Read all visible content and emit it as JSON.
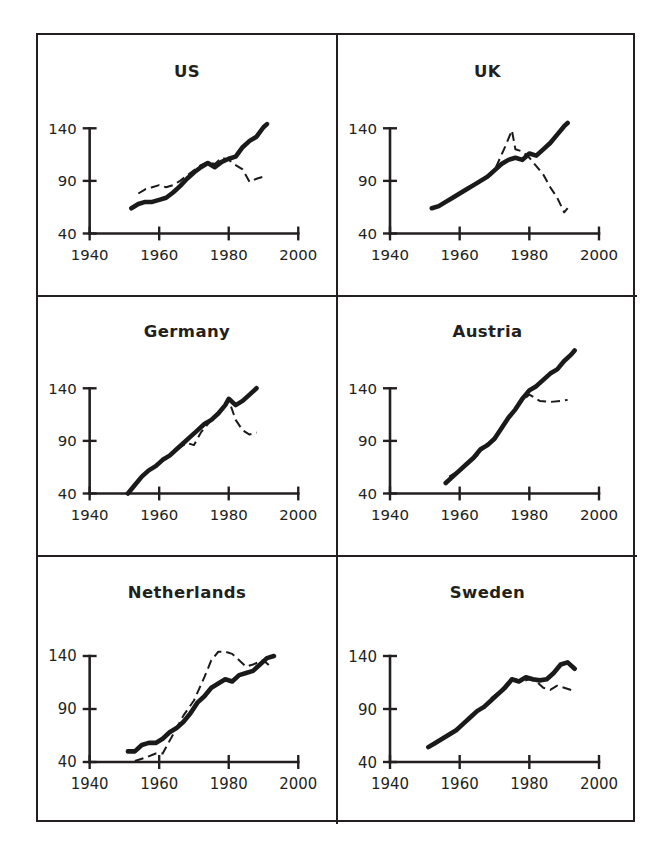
{
  "figure": {
    "layout": "2x3 grid of small-multiple line charts",
    "panel_order": [
      "US",
      "UK",
      "Germany",
      "Austria",
      "Netherlands",
      "Sweden"
    ]
  },
  "axes": {
    "x_ticks": [
      1940,
      1960,
      1980,
      2000
    ],
    "x_tick_labels": [
      "1940",
      "1960",
      "1980",
      "2000"
    ],
    "y_ticks": [
      40,
      90,
      140
    ],
    "y_tick_labels": [
      "140",
      "90",
      "40"
    ],
    "xlim": [
      1940,
      2000
    ],
    "ylim": [
      40,
      190
    ]
  },
  "titles": {
    "us": "US",
    "uk": "UK",
    "germany": "Germany",
    "austria": "Austria",
    "netherlands": "Netherlands",
    "sweden": "Sweden"
  },
  "colors": {
    "ink": "#231f20",
    "background": "#ffffff",
    "series_solid": "#1a1a1a",
    "series_dashed": "#1a1a1a"
  },
  "chart_data": [
    {
      "type": "line",
      "title": "US",
      "xlabel": "",
      "ylabel": "",
      "xlim": [
        1940,
        2000
      ],
      "ylim": [
        40,
        190
      ],
      "xticks": [
        1940,
        1960,
        1980,
        2000
      ],
      "yticks": [
        40,
        90,
        140
      ],
      "grid": false,
      "legend": "none",
      "series": [
        {
          "name": "solid",
          "style": "solid-thick",
          "x": [
            1952,
            1954,
            1956,
            1958,
            1960,
            1962,
            1964,
            1966,
            1968,
            1970,
            1972,
            1974,
            1976,
            1978,
            1980,
            1982,
            1984,
            1986,
            1988,
            1990,
            1991
          ],
          "y": [
            64,
            68,
            70,
            70,
            72,
            74,
            79,
            85,
            92,
            98,
            103,
            107,
            103,
            108,
            111,
            113,
            122,
            128,
            132,
            141,
            144
          ]
        },
        {
          "name": "dashed",
          "style": "dashed-thin",
          "x": [
            1954,
            1956,
            1958,
            1960,
            1962,
            1964,
            1966,
            1968,
            1970,
            1972,
            1974,
            1976,
            1978,
            1980,
            1982,
            1984,
            1986,
            1988,
            1990
          ],
          "y": [
            78,
            82,
            84,
            86,
            84,
            86,
            90,
            95,
            100,
            105,
            108,
            106,
            112,
            110,
            105,
            101,
            89,
            92,
            94
          ]
        }
      ]
    },
    {
      "type": "line",
      "title": "UK",
      "xlabel": "",
      "ylabel": "",
      "xlim": [
        1940,
        2000
      ],
      "ylim": [
        40,
        190
      ],
      "xticks": [
        1940,
        1960,
        1980,
        2000
      ],
      "yticks": [
        40,
        90,
        140
      ],
      "grid": false,
      "legend": "none",
      "series": [
        {
          "name": "solid",
          "style": "solid-thick",
          "x": [
            1952,
            1954,
            1956,
            1958,
            1960,
            1962,
            1964,
            1966,
            1968,
            1970,
            1972,
            1974,
            1976,
            1978,
            1980,
            1982,
            1984,
            1986,
            1988,
            1990,
            1991
          ],
          "y": [
            64,
            66,
            70,
            74,
            78,
            82,
            86,
            90,
            94,
            100,
            106,
            110,
            112,
            110,
            116,
            114,
            120,
            126,
            134,
            142,
            145
          ]
        },
        {
          "name": "dashed",
          "style": "dashed-thin",
          "x": [
            1954,
            1958,
            1962,
            1966,
            1970,
            1973,
            1975,
            1976,
            1978,
            1980,
            1982,
            1984,
            1986,
            1988,
            1990,
            1991
          ],
          "y": [
            66,
            74,
            82,
            90,
            100,
            122,
            138,
            120,
            118,
            112,
            104,
            96,
            84,
            74,
            60,
            64
          ]
        }
      ]
    },
    {
      "type": "line",
      "title": "Germany",
      "xlabel": "",
      "ylabel": "",
      "xlim": [
        1940,
        2000
      ],
      "ylim": [
        40,
        190
      ],
      "xticks": [
        1940,
        1960,
        1980,
        2000
      ],
      "yticks": [
        40,
        90,
        140
      ],
      "grid": false,
      "legend": "none",
      "series": [
        {
          "name": "solid",
          "style": "solid-thick",
          "x": [
            1951,
            1953,
            1955,
            1957,
            1959,
            1961,
            1963,
            1965,
            1967,
            1969,
            1971,
            1973,
            1975,
            1977,
            1979,
            1980,
            1982,
            1984,
            1986,
            1988
          ],
          "y": [
            40,
            48,
            56,
            62,
            66,
            72,
            76,
            82,
            88,
            94,
            100,
            106,
            110,
            116,
            124,
            130,
            124,
            128,
            134,
            140
          ]
        },
        {
          "name": "dashed",
          "style": "dashed-thin",
          "x": [
            1962,
            1965,
            1968,
            1970,
            1972,
            1975,
            1978,
            1980,
            1982,
            1984,
            1986,
            1988
          ],
          "y": [
            74,
            82,
            88,
            86,
            98,
            110,
            120,
            129,
            110,
            100,
            96,
            98
          ]
        }
      ]
    },
    {
      "type": "line",
      "title": "Austria",
      "xlabel": "",
      "ylabel": "",
      "xlim": [
        1940,
        2000
      ],
      "ylim": [
        40,
        190
      ],
      "xticks": [
        1940,
        1960,
        1980,
        2000
      ],
      "yticks": [
        40,
        90,
        140
      ],
      "grid": false,
      "legend": "none",
      "series": [
        {
          "name": "solid",
          "style": "solid-thick",
          "x": [
            1956,
            1958,
            1960,
            1962,
            1964,
            1966,
            1968,
            1970,
            1972,
            1974,
            1976,
            1978,
            1980,
            1982,
            1984,
            1986,
            1988,
            1990,
            1992,
            1993
          ],
          "y": [
            50,
            56,
            62,
            68,
            74,
            82,
            86,
            92,
            102,
            112,
            120,
            130,
            138,
            142,
            148,
            154,
            158,
            166,
            172,
            176
          ]
        },
        {
          "name": "dashed",
          "style": "dashed-thin",
          "x": [
            1957,
            1959,
            1962,
            1965,
            1968,
            1970,
            1974,
            1978,
            1980,
            1983,
            1986,
            1989,
            1991
          ],
          "y": [
            56,
            60,
            68,
            76,
            88,
            92,
            112,
            128,
            134,
            128,
            127,
            128,
            129
          ]
        }
      ]
    },
    {
      "type": "line",
      "title": "Netherlands",
      "xlabel": "",
      "ylabel": "",
      "xlim": [
        1940,
        2000
      ],
      "ylim": [
        40,
        190
      ],
      "xticks": [
        1940,
        1960,
        1980,
        2000
      ],
      "yticks": [
        40,
        90,
        140
      ],
      "grid": false,
      "legend": "none",
      "series": [
        {
          "name": "solid",
          "style": "solid-thick",
          "x": [
            1951,
            1953,
            1955,
            1957,
            1959,
            1961,
            1963,
            1965,
            1967,
            1969,
            1971,
            1973,
            1975,
            1977,
            1979,
            1981,
            1983,
            1985,
            1987,
            1989,
            1991,
            1993
          ],
          "y": [
            50,
            50,
            56,
            58,
            58,
            62,
            68,
            72,
            78,
            86,
            96,
            102,
            110,
            114,
            118,
            116,
            122,
            124,
            126,
            132,
            138,
            140
          ]
        },
        {
          "name": "dashed",
          "style": "dashed-thin",
          "x": [
            1953,
            1956,
            1959,
            1961,
            1964,
            1967,
            1970,
            1973,
            1975,
            1977,
            1979,
            1981,
            1983,
            1985,
            1987,
            1990,
            1992
          ],
          "y": [
            41,
            44,
            48,
            48,
            66,
            84,
            98,
            120,
            136,
            144,
            144,
            142,
            136,
            130,
            132,
            136,
            130
          ]
        }
      ]
    },
    {
      "type": "line",
      "title": "Sweden",
      "xlabel": "",
      "ylabel": "",
      "xlim": [
        1940,
        2000
      ],
      "ylim": [
        40,
        190
      ],
      "xticks": [
        1940,
        1960,
        1980,
        2000
      ],
      "yticks": [
        40,
        90,
        140
      ],
      "grid": false,
      "legend": "none",
      "series": [
        {
          "name": "solid",
          "style": "solid-thick",
          "x": [
            1951,
            1953,
            1955,
            1957,
            1959,
            1961,
            1963,
            1965,
            1967,
            1969,
            1971,
            1973,
            1975,
            1977,
            1979,
            1981,
            1983,
            1985,
            1987,
            1989,
            1991,
            1993
          ],
          "y": [
            54,
            58,
            62,
            66,
            70,
            76,
            82,
            88,
            92,
            98,
            104,
            110,
            118,
            116,
            120,
            118,
            117,
            118,
            124,
            132,
            134,
            128
          ]
        },
        {
          "name": "dashed",
          "style": "dashed-thin",
          "x": [
            1969,
            1972,
            1974,
            1976,
            1978,
            1980,
            1982,
            1984,
            1986,
            1988,
            1990,
            1992
          ],
          "y": [
            100,
            108,
            116,
            118,
            116,
            118,
            116,
            110,
            108,
            112,
            110,
            108
          ]
        }
      ]
    }
  ]
}
